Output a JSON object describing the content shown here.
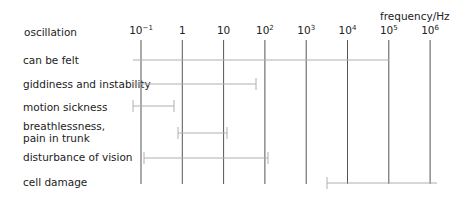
{
  "chart_data": {
    "type": "range-bar",
    "title": "",
    "xlabel": "frequency/Hz",
    "row_header": "oscillation",
    "x_scale": "log10",
    "xlim": [
      0.1,
      1000000
    ],
    "ticks": [
      {
        "base": "10",
        "exp": "−1",
        "value": 0.1
      },
      {
        "base": "1",
        "exp": "",
        "value": 1
      },
      {
        "base": "10",
        "exp": "",
        "value": 10
      },
      {
        "base": "10",
        "exp": "2",
        "value": 100
      },
      {
        "base": "10",
        "exp": "3",
        "value": 1000
      },
      {
        "base": "10",
        "exp": "4",
        "value": 10000
      },
      {
        "base": "10",
        "exp": "5",
        "value": 100000
      },
      {
        "base": "10",
        "exp": "6",
        "value": 1000000
      }
    ],
    "series": [
      {
        "name": "can be felt",
        "from": 0.06,
        "to": 100000
      },
      {
        "name": "giddiness and instability",
        "from": 0.06,
        "to": 60
      },
      {
        "name": "motion sickness",
        "from": 0.06,
        "to": 0.5
      },
      {
        "name": "breathlessness, pain in trunk",
        "from": 0.8,
        "to": 12
      },
      {
        "name": "disturbance of vision",
        "from": 0.12,
        "to": 120
      },
      {
        "name": "cell damage",
        "from": 25000,
        "to": 1500000
      }
    ],
    "grid": true
  },
  "labels": {
    "row_header": "oscillation",
    "axis_title": "frequency/Hz",
    "rows": [
      "can be felt",
      "giddiness and instability",
      "motion sickness",
      "breathlessness,",
      "pain in trunk",
      "disturbance of vision",
      "cell damage"
    ]
  },
  "colors": {
    "grid": "#555555",
    "bar": "#b0b0b0",
    "text": "#222222"
  }
}
